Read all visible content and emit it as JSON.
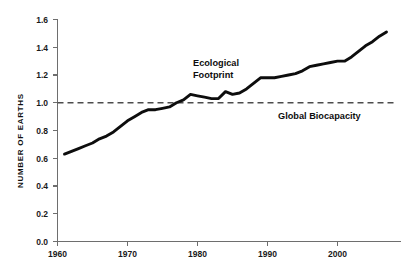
{
  "chart_data": {
    "type": "line",
    "title": "",
    "xlabel": "",
    "ylabel": "NUMBER OF EARTHS",
    "xlim": [
      1960,
      2008
    ],
    "ylim": [
      0.0,
      1.6
    ],
    "grid": false,
    "legend": "inline-annotations",
    "x_ticks": [
      "1960",
      "1970",
      "1980",
      "1990",
      "2000"
    ],
    "x_tick_values": [
      1960,
      1970,
      1980,
      1990,
      2000
    ],
    "y_ticks": [
      "0.0",
      "0.2",
      "0.4",
      "0.6",
      "0.8",
      "1.0",
      "1.2",
      "1.4",
      "1.6"
    ],
    "y_tick_values": [
      0.0,
      0.2,
      0.4,
      0.6,
      0.8,
      1.0,
      1.2,
      1.4,
      1.6
    ],
    "series": [
      {
        "name": "Ecological Footprint",
        "style": "solid",
        "color": "#0d0d0d",
        "x": [
          1961,
          1962,
          1963,
          1964,
          1965,
          1966,
          1967,
          1968,
          1969,
          1970,
          1971,
          1972,
          1973,
          1974,
          1975,
          1976,
          1977,
          1978,
          1979,
          1980,
          1981,
          1982,
          1983,
          1984,
          1985,
          1986,
          1987,
          1988,
          1989,
          1990,
          1991,
          1992,
          1993,
          1994,
          1995,
          1996,
          1997,
          1998,
          1999,
          2000,
          2001,
          2002,
          2003,
          2004,
          2005,
          2006,
          2007
        ],
        "values": [
          0.63,
          0.65,
          0.67,
          0.69,
          0.71,
          0.74,
          0.76,
          0.79,
          0.83,
          0.87,
          0.9,
          0.93,
          0.95,
          0.95,
          0.96,
          0.97,
          1.0,
          1.02,
          1.06,
          1.05,
          1.04,
          1.03,
          1.03,
          1.08,
          1.06,
          1.07,
          1.1,
          1.14,
          1.18,
          1.18,
          1.18,
          1.19,
          1.2,
          1.21,
          1.23,
          1.26,
          1.27,
          1.28,
          1.29,
          1.3,
          1.3,
          1.33,
          1.37,
          1.41,
          1.44,
          1.48,
          1.51
        ]
      },
      {
        "name": "Global Biocapacity",
        "style": "dashed",
        "color": "#4d4d4d",
        "constant_value": 1.0
      }
    ],
    "annotations": [
      {
        "text_line1": "Ecological",
        "text_line2": "Footprint",
        "at_x": 1979,
        "at_y": 1.3
      },
      {
        "text_line1": "Global Biocapacity",
        "text_line2": "",
        "at_x": 1992,
        "at_y": 0.93
      }
    ]
  },
  "labels": {
    "y_axis_title": "NUMBER OF EARTHS",
    "footprint_line1": "Ecological",
    "footprint_line2": "Footprint",
    "biocapacity": "Global Biocapacity"
  },
  "ticks": {
    "y": [
      "1.6",
      "1.4",
      "1.2",
      "1.0",
      "0.8",
      "0.6",
      "0.4",
      "0.2",
      "0.0"
    ],
    "x": [
      "1960",
      "1970",
      "1980",
      "1990",
      "2000"
    ]
  },
  "colors": {
    "series_line": "#0d0d0d",
    "reference_line": "#4d4d4d",
    "axis": "#6e6e6e",
    "text": "#111111",
    "background": "#ffffff"
  }
}
